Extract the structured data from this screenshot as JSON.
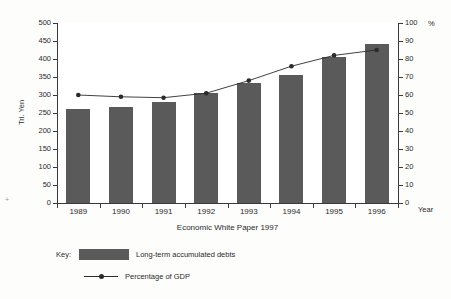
{
  "chart_data": {
    "type": "bar",
    "title": "",
    "subtitle": "",
    "source": "Economic White Paper 1997",
    "categories": [
      "1989",
      "1990",
      "1991",
      "1992",
      "1993",
      "1994",
      "1995",
      "1996"
    ],
    "xlabel": "Year",
    "ylabel": "Tri. Yen",
    "ylabel_right": "%",
    "ylim": [
      0,
      500
    ],
    "ylim_right": [
      0,
      100
    ],
    "yticks": [
      0,
      50,
      100,
      150,
      200,
      250,
      300,
      350,
      400,
      450,
      500
    ],
    "yticks_right": [
      0,
      10,
      20,
      30,
      40,
      50,
      60,
      70,
      80,
      90,
      100
    ],
    "grid": false,
    "legend_position": "below",
    "series": [
      {
        "name": "Long-term accumulated debts",
        "type": "bar",
        "axis": "left",
        "unit": "Tri. Yen",
        "color": "#5a5a5a",
        "values": [
          262,
          268,
          280,
          305,
          332,
          355,
          405,
          442
        ]
      },
      {
        "name": "Percentage of GDP",
        "type": "line",
        "axis": "right",
        "unit": "%",
        "color": "#2b2b2b",
        "values": [
          60,
          59,
          58.5,
          61,
          68,
          76,
          82,
          85
        ]
      }
    ]
  },
  "legend": {
    "key_label": "Key:",
    "items": [
      {
        "label": "Long-term accumulated debts",
        "marker": "swatch",
        "color": "#5a5a5a"
      },
      {
        "label": "Percentage of GDP",
        "marker": "line-dot",
        "color": "#2b2b2b"
      }
    ]
  }
}
